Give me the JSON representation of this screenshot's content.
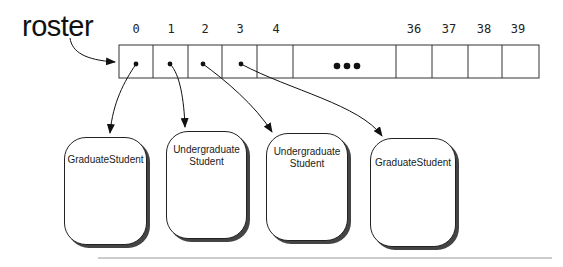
{
  "diagram": {
    "variable_label": "roster",
    "array": {
      "indices": [
        "0",
        "1",
        "2",
        "3",
        "4",
        "36",
        "37",
        "38",
        "39"
      ],
      "ellipsis": "•••"
    },
    "objects": [
      {
        "label": "GraduateStudent",
        "referenced_by_index": "0"
      },
      {
        "label": "Undergraduate\nStudent",
        "referenced_by_index": "1"
      },
      {
        "label": "Undergraduate\nStudent",
        "referenced_by_index": "2"
      },
      {
        "label": "GraduateStudent",
        "referenced_by_index": "3"
      }
    ],
    "colors": {
      "line": "#222222",
      "shadow": "#444444",
      "rule": "#999999"
    }
  }
}
